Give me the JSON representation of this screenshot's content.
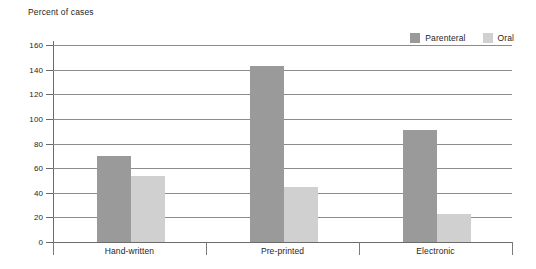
{
  "chart_data": {
    "type": "bar",
    "title": "Percent of cases",
    "xlabel": "",
    "ylabel": "Percent of cases",
    "categories": [
      "Hand-written",
      "Pre-printed",
      "Electronic"
    ],
    "series": [
      {
        "name": "Parenteral",
        "color": "#9a9a9a",
        "values": [
          70,
          143,
          91
        ]
      },
      {
        "name": "Oral",
        "color": "#d0d0d0",
        "values": [
          54,
          45,
          23
        ]
      }
    ],
    "ylim": [
      0,
      160
    ],
    "ytick_step": 20,
    "ytick_labels": [
      "160",
      "140",
      "120",
      "100",
      "80",
      "60",
      "40",
      "20",
      "0"
    ],
    "ytick_values": [
      160,
      140,
      120,
      100,
      80,
      60,
      40,
      20,
      0
    ],
    "grid": true,
    "legend_position": "top-right"
  },
  "legend": {
    "entries": [
      {
        "label": "Parenteral",
        "swatch": "legend-swatch-parenteral"
      },
      {
        "label": "Oral",
        "swatch": "legend-swatch-oral"
      }
    ]
  },
  "colors": {
    "parenteral": "#9a9a9a",
    "oral": "#d0d0d0",
    "gridline": "#8c8c8c",
    "axis": "#6b6b6b",
    "text": "#262626",
    "background": "#ffffff"
  }
}
